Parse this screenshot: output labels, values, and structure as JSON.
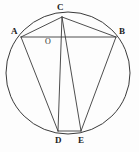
{
  "figure": {
    "kind": "circle-geometry-diagram",
    "background_color": "#fdfdfd",
    "stroke_color": "#3a3a3a",
    "label_color": "#222222",
    "width": 139,
    "height": 152,
    "circle": {
      "name": "circumscribed-circle",
      "center_x": 68,
      "center_y": 73,
      "radius_x": 62,
      "radius_y": 61
    },
    "points": [
      {
        "id": "A",
        "label": "A",
        "x": 21,
        "y": 37,
        "label_x": 11,
        "label_y": 27
      },
      {
        "id": "B",
        "label": "B",
        "x": 116,
        "y": 37,
        "label_x": 119,
        "label_y": 27
      },
      {
        "id": "C",
        "label": "C",
        "x": 62,
        "y": 17,
        "label_x": 57,
        "label_y": 3
      },
      {
        "id": "D",
        "label": "D",
        "x": 58,
        "y": 131,
        "label_x": 55,
        "label_y": 135
      },
      {
        "id": "E",
        "label": "E",
        "x": 81,
        "y": 131,
        "label_x": 78,
        "label_y": 135
      },
      {
        "id": "O",
        "label": "O",
        "x": 48,
        "y": 41,
        "label_x": 45,
        "label_y": 39
      }
    ],
    "segments": [
      {
        "id": "AB",
        "from": "A",
        "to": "B"
      },
      {
        "id": "CA",
        "from": "C",
        "to": "A"
      },
      {
        "id": "CB",
        "from": "C",
        "to": "B"
      },
      {
        "id": "CD",
        "from": "C",
        "to": "D"
      },
      {
        "id": "CE",
        "from": "C",
        "to": "E"
      },
      {
        "id": "AD",
        "from": "A",
        "to": "D"
      },
      {
        "id": "BE",
        "from": "B",
        "to": "E"
      },
      {
        "id": "DE",
        "from": "D",
        "to": "E"
      }
    ]
  }
}
